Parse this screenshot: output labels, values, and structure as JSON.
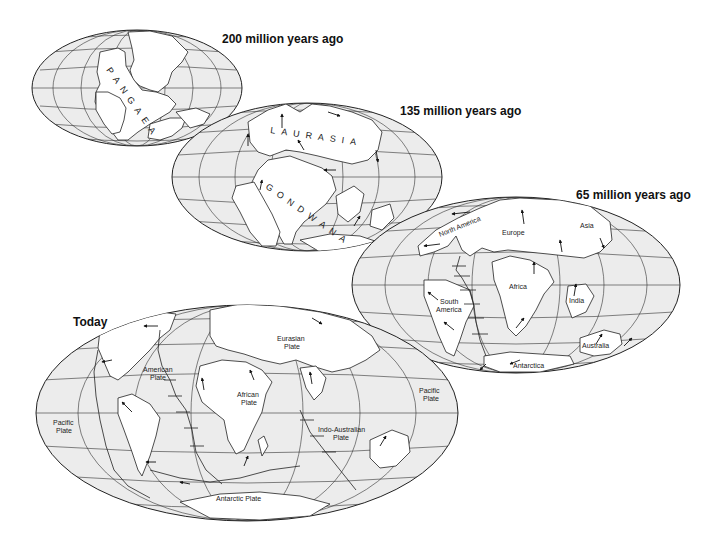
{
  "figure": {
    "panels": [
      {
        "id": "p200",
        "title": "200 million years ago",
        "supercontinent_label": "PANGAEA",
        "labels": []
      },
      {
        "id": "p135",
        "title": "135 million years ago",
        "supercontinent_labels": [
          "LAURASIA",
          "GONDWANA"
        ],
        "labels": []
      },
      {
        "id": "p65",
        "title": "65 million years ago",
        "labels": [
          "North America",
          "Europe",
          "Asia",
          "Africa",
          "South America",
          "India",
          "Australia",
          "Antarctica"
        ]
      },
      {
        "id": "today",
        "title": "Today",
        "labels": [
          "Eurasian Plate",
          "American Plate",
          "African Plate",
          "Pacific Plate",
          "Pacific Plate",
          "Indo-Australian Plate",
          "Antarctic Plate"
        ]
      }
    ]
  },
  "titles": {
    "p200": "200 million years ago",
    "p135": "135 million years ago",
    "p65": "65 million years ago",
    "today": "Today"
  },
  "p200": {
    "pangaea": "PANGAEA"
  },
  "p135": {
    "laurasia": "LAURASIA",
    "gondwana": "GONDWANA"
  },
  "p65": {
    "north_america": "North America",
    "europe": "Europe",
    "asia": "Asia",
    "africa": "Africa",
    "south_america_1": "South",
    "south_america_2": "America",
    "india": "India",
    "australia": "Australia",
    "antarctica": "Antarctica"
  },
  "today": {
    "eurasian_1": "Eurasian",
    "eurasian_2": "Plate",
    "american_1": "American",
    "american_2": "Plate",
    "african_1": "African",
    "african_2": "Plate",
    "pacific_w_1": "Pacific",
    "pacific_w_2": "Plate",
    "pacific_e_1": "Pacific",
    "pacific_e_2": "Plate",
    "indo_1": "Indo-Australian",
    "indo_2": "Plate",
    "antarctic": "Antarctic Plate"
  },
  "colors": {
    "ocean": "#ececec",
    "land": "#ffffff",
    "lines": "#222222",
    "background": "#ffffff"
  }
}
